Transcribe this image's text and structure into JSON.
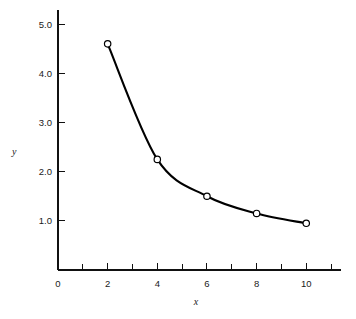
{
  "chart_data": {
    "type": "line",
    "title": "",
    "subtitle": "",
    "xlabel": "x",
    "ylabel": "y",
    "x": [
      2,
      4,
      6,
      8,
      10
    ],
    "values": [
      4.6,
      2.25,
      1.5,
      1.15,
      0.95
    ],
    "series": [
      {
        "name": "",
        "x": [
          2,
          4,
          6,
          8,
          10
        ],
        "values": [
          4.6,
          2.25,
          1.5,
          1.15,
          0.95
        ]
      }
    ],
    "xlim": [
      0,
      11.4
    ],
    "ylim": [
      0,
      5.35
    ],
    "grid": false,
    "legend": false,
    "legend_position": "none",
    "marker": "open-circle",
    "line_color": "#000000",
    "marker_fill": "#ffffff",
    "background": "#ffffff",
    "x_major_ticks": [
      0,
      2,
      4,
      6,
      8,
      10
    ],
    "x_major_tick_labels": [
      "0",
      "2",
      "4",
      "6",
      "8",
      "10"
    ],
    "x_minor_ticks": [
      1,
      3,
      5,
      7,
      9,
      11
    ],
    "y_major_ticks": [
      1.0,
      2.0,
      3.0,
      4.0,
      5.0
    ],
    "y_major_tick_labels": [
      "1.0",
      "2.0",
      "3.0",
      "4.0",
      "5.0"
    ],
    "annotations": []
  },
  "figure": {
    "axis_color": "#111111",
    "text_color": "#1a1a1a"
  }
}
